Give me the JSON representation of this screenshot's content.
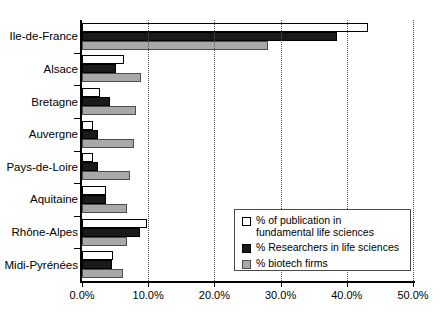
{
  "chart_data": {
    "type": "bar",
    "orientation": "horizontal",
    "title": "",
    "xlabel": "",
    "ylabel": "",
    "xlim": [
      0,
      50
    ],
    "xticks": [
      "0.0%",
      "10.0%",
      "20.0%",
      "30.0%",
      "40.0%",
      "50.0%"
    ],
    "xtick_values": [
      0,
      10,
      20,
      30,
      40,
      50
    ],
    "grid": "vertical-dotted",
    "legend_position": "inside-lower-right",
    "categories": [
      "Ile-de-France",
      "Alsace",
      "Bretagne",
      "Auvergne",
      "Pays-de-Loire",
      "Aquitaine",
      "Rhône-Alpes",
      "Midi-Pyrénées"
    ],
    "series": [
      {
        "name": "% of publication in\nfundamental life sciences",
        "color": "#ffffff",
        "values": [
          43.2,
          6.3,
          2.7,
          1.7,
          1.7,
          3.6,
          9.8,
          4.7
        ]
      },
      {
        "name": "% Researchers in life sciences",
        "color": "#1a1a1a",
        "values": [
          38.5,
          5.1,
          4.2,
          2.4,
          2.4,
          3.6,
          8.8,
          4.5
        ]
      },
      {
        "name": "% biotech firms",
        "color": "#a8a8a8",
        "values": [
          28.1,
          8.9,
          8.2,
          7.9,
          7.3,
          6.8,
          6.8,
          6.2
        ]
      }
    ]
  },
  "legend": {
    "items": [
      {
        "label": "% of publication in\nfundamental life sciences",
        "swatch": "s0"
      },
      {
        "label": "% Researchers in life sciences",
        "swatch": "s1"
      },
      {
        "label": "% biotech firms",
        "swatch": "s2"
      }
    ]
  }
}
